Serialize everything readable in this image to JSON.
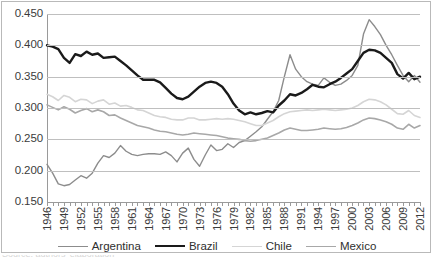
{
  "chart_data": {
    "type": "line",
    "title": "",
    "subtitle": "",
    "xlabel": "",
    "ylabel": "",
    "xlim": [
      1946,
      2012
    ],
    "ylim": [
      0.15,
      0.45
    ],
    "grid": true,
    "legend_position": "bottom",
    "ytick_labels": [
      "0.450",
      "0.400",
      "0.350",
      "0.300",
      "0.250",
      "0.200",
      "0.150"
    ],
    "ytick_values": [
      0.45,
      0.4,
      0.35,
      0.3,
      0.25,
      0.2,
      0.15
    ],
    "xtick_labels": [
      "1946",
      "1949",
      "1952",
      "1955",
      "1958",
      "1961",
      "1964",
      "1967",
      "1970",
      "1973",
      "1976",
      "1979",
      "1982",
      "1985",
      "1988",
      "1991",
      "1994",
      "1997",
      "2000",
      "2003",
      "2006",
      "2009",
      "2012"
    ],
    "xtick_values": [
      1946,
      1949,
      1952,
      1955,
      1958,
      1961,
      1964,
      1967,
      1970,
      1973,
      1976,
      1979,
      1982,
      1985,
      1988,
      1991,
      1994,
      1997,
      2000,
      2003,
      2006,
      2009,
      2012
    ],
    "x": [
      1946,
      1947,
      1948,
      1949,
      1950,
      1951,
      1952,
      1953,
      1954,
      1955,
      1956,
      1957,
      1958,
      1959,
      1960,
      1961,
      1962,
      1963,
      1964,
      1965,
      1966,
      1967,
      1968,
      1969,
      1970,
      1971,
      1972,
      1973,
      1974,
      1975,
      1976,
      1977,
      1978,
      1979,
      1980,
      1981,
      1982,
      1983,
      1984,
      1985,
      1986,
      1987,
      1988,
      1989,
      1990,
      1991,
      1992,
      1993,
      1994,
      1995,
      1996,
      1997,
      1998,
      1999,
      2000,
      2001,
      2002,
      2003,
      2004,
      2005,
      2006,
      2007,
      2008,
      2009,
      2010,
      2011,
      2012
    ],
    "series": [
      {
        "name": "Argentina",
        "color": "#8c8c8c",
        "width": 1.4,
        "values": [
          0.21,
          0.196,
          0.179,
          0.176,
          0.178,
          0.185,
          0.192,
          0.188,
          0.196,
          0.212,
          0.224,
          0.221,
          0.228,
          0.24,
          0.231,
          0.226,
          0.224,
          0.226,
          0.227,
          0.227,
          0.226,
          0.23,
          0.224,
          0.214,
          0.228,
          0.236,
          0.218,
          0.207,
          0.225,
          0.241,
          0.232,
          0.234,
          0.243,
          0.237,
          0.245,
          0.248,
          0.255,
          0.262,
          0.27,
          0.282,
          0.294,
          0.312,
          0.35,
          0.385,
          0.362,
          0.35,
          0.342,
          0.338,
          0.336,
          0.348,
          0.341,
          0.336,
          0.338,
          0.344,
          0.352,
          0.368,
          0.418,
          0.441,
          0.43,
          0.417,
          0.4,
          0.385,
          0.368,
          0.352,
          0.342,
          0.352,
          0.341
        ]
      },
      {
        "name": "Brazil",
        "color": "#1a1a1a",
        "width": 2.4,
        "values": [
          0.4,
          0.398,
          0.394,
          0.38,
          0.372,
          0.386,
          0.383,
          0.39,
          0.385,
          0.387,
          0.38,
          0.381,
          0.382,
          0.375,
          0.368,
          0.36,
          0.352,
          0.345,
          0.345,
          0.345,
          0.341,
          0.332,
          0.323,
          0.316,
          0.314,
          0.318,
          0.326,
          0.334,
          0.34,
          0.342,
          0.34,
          0.334,
          0.322,
          0.307,
          0.296,
          0.29,
          0.293,
          0.29,
          0.292,
          0.295,
          0.293,
          0.304,
          0.312,
          0.322,
          0.32,
          0.324,
          0.33,
          0.337,
          0.334,
          0.333,
          0.338,
          0.342,
          0.348,
          0.355,
          0.362,
          0.375,
          0.388,
          0.393,
          0.392,
          0.388,
          0.38,
          0.372,
          0.354,
          0.347,
          0.356,
          0.346,
          0.35
        ]
      },
      {
        "name": "Chile",
        "color": "#d5d5d5",
        "width": 1.6,
        "values": [
          0.322,
          0.318,
          0.312,
          0.32,
          0.317,
          0.31,
          0.314,
          0.313,
          0.307,
          0.311,
          0.313,
          0.306,
          0.308,
          0.303,
          0.304,
          0.301,
          0.297,
          0.296,
          0.292,
          0.288,
          0.286,
          0.285,
          0.282,
          0.281,
          0.281,
          0.284,
          0.284,
          0.281,
          0.281,
          0.282,
          0.283,
          0.282,
          0.283,
          0.282,
          0.28,
          0.278,
          0.275,
          0.272,
          0.272,
          0.276,
          0.28,
          0.286,
          0.291,
          0.294,
          0.295,
          0.296,
          0.297,
          0.296,
          0.297,
          0.298,
          0.297,
          0.296,
          0.297,
          0.298,
          0.3,
          0.304,
          0.31,
          0.314,
          0.313,
          0.31,
          0.305,
          0.298,
          0.291,
          0.29,
          0.296,
          0.288,
          0.285
        ]
      },
      {
        "name": "Mexico",
        "color": "#a8a8a8",
        "width": 1.6,
        "values": [
          0.305,
          0.301,
          0.297,
          0.302,
          0.298,
          0.292,
          0.296,
          0.299,
          0.294,
          0.297,
          0.294,
          0.288,
          0.289,
          0.284,
          0.28,
          0.276,
          0.272,
          0.27,
          0.268,
          0.265,
          0.263,
          0.262,
          0.26,
          0.258,
          0.257,
          0.258,
          0.26,
          0.259,
          0.258,
          0.257,
          0.256,
          0.254,
          0.252,
          0.251,
          0.25,
          0.248,
          0.247,
          0.248,
          0.25,
          0.252,
          0.256,
          0.26,
          0.265,
          0.268,
          0.266,
          0.264,
          0.264,
          0.265,
          0.266,
          0.268,
          0.267,
          0.266,
          0.267,
          0.269,
          0.272,
          0.276,
          0.281,
          0.284,
          0.283,
          0.281,
          0.278,
          0.274,
          0.268,
          0.266,
          0.274,
          0.268,
          0.272
        ]
      }
    ]
  },
  "legend": {
    "items": [
      {
        "label": "Argentina",
        "color": "#8c8c8c",
        "width": 1.6
      },
      {
        "label": "Brazil",
        "color": "#1a1a1a",
        "width": 2.6
      },
      {
        "label": "Chile",
        "color": "#d5d5d5",
        "width": 1.8
      },
      {
        "label": "Mexico",
        "color": "#a8a8a8",
        "width": 1.8
      }
    ]
  },
  "caption": {
    "cut_text": "Source: authors' elaboration"
  }
}
